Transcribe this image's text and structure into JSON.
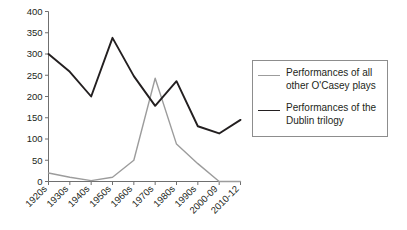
{
  "chart_data": {
    "type": "line",
    "title": "",
    "subtitle": "",
    "xlabel": "",
    "ylabel": "",
    "categories": [
      "1920s",
      "1930s",
      "1940s",
      "1950s",
      "1960s",
      "1970s",
      "1980s",
      "1990s",
      "2000-09",
      "2010-12"
    ],
    "ylim": [
      0,
      400
    ],
    "yticks": [
      0,
      50,
      100,
      150,
      200,
      250,
      300,
      350,
      400
    ],
    "ytick_labels": [
      "0",
      "50",
      "100",
      "150",
      "200",
      "250",
      "300",
      "350",
      "400"
    ],
    "grid": false,
    "legend_position": "right",
    "series": [
      {
        "name": "Performances of all other O'Casey plays",
        "color": "#9c9c9c",
        "values": [
          20,
          10,
          2,
          10,
          50,
          243,
          88,
          42,
          0,
          0
        ]
      },
      {
        "name": "Performances of the Dublin trilogy",
        "color": "#231f20",
        "values": [
          300,
          258,
          200,
          338,
          248,
          178,
          236,
          130,
          113,
          145
        ]
      }
    ]
  },
  "legend": {
    "entries": [
      {
        "label": "Performances of all\nother O'Casey plays",
        "swatch": "gray"
      },
      {
        "label": "Performances of the\nDublin trilogy",
        "swatch": "dark"
      }
    ]
  },
  "axes": {
    "y_axis_name": "y-axis",
    "x_axis_name": "x-axis"
  }
}
